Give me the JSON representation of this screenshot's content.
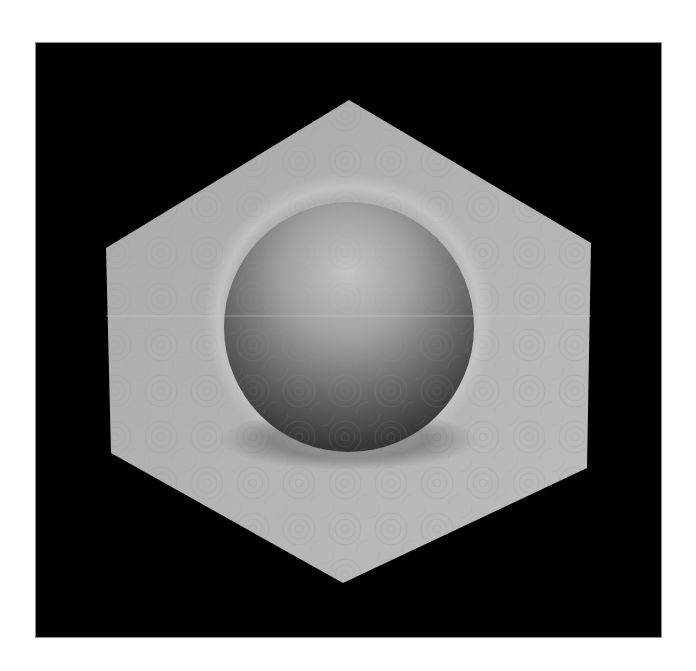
{
  "image": {
    "description": "3D render of a shaded gray sphere resting in a hexagonal gray plate with a swirl-textured surface, on a black background framed by white margins",
    "background_color": "#ffffff",
    "frame_color": "#000000"
  },
  "scene": {
    "hexagon": {
      "fill_light": "#b8b8b8",
      "fill_dark": "#8c8c8c",
      "vertices": [
        [
          349,
          100
        ],
        [
          591,
          243
        ],
        [
          587,
          468
        ],
        [
          343,
          583
        ],
        [
          111,
          453
        ],
        [
          106,
          248
        ]
      ]
    },
    "sphere": {
      "cx": 349,
      "cy": 327,
      "r": 125,
      "highlight": "#c4c4c4",
      "mid": "#8e8e8e",
      "shadow": "#2c2c2c"
    },
    "halo": {
      "color": "#c9c9c9"
    },
    "scanline": {
      "y": 316,
      "color": "#d0d0d0"
    }
  }
}
